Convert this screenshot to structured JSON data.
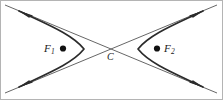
{
  "figure": {
    "kind": "hyperbola-diagram",
    "background_color": "#ffffff",
    "stroke_color": "#3c3c3c",
    "curve_color": "#2b2b2b",
    "border_color": "#b4b4b4",
    "point_color": "#111111"
  },
  "labels": {
    "focus_left": {
      "base": "F",
      "sub": "1"
    },
    "focus_right": {
      "base": "F",
      "sub": "2"
    },
    "center": "C"
  },
  "points": {
    "focus_left": {
      "x": 63,
      "y": 49
    },
    "focus_right": {
      "x": 157,
      "y": 49
    },
    "center": {
      "x": 111,
      "y": 49
    }
  },
  "geometry": {
    "center_x": 111,
    "center_y": 49,
    "vertex_left_x": 85,
    "vertex_right_x": 137,
    "asymptote_slope": 0.72,
    "arrowhead_count": 4,
    "branch_count": 2,
    "asymptote_count": 2
  },
  "elements": [
    {
      "name": "asymptote-up-right",
      "type": "line"
    },
    {
      "name": "asymptote-up-left",
      "type": "line"
    },
    {
      "name": "hyperbola-branch-left",
      "type": "curve"
    },
    {
      "name": "hyperbola-branch-right",
      "type": "curve"
    },
    {
      "name": "arrowhead-top-left",
      "type": "arrow"
    },
    {
      "name": "arrowhead-top-right",
      "type": "arrow"
    },
    {
      "name": "arrowhead-bottom-left",
      "type": "arrow"
    },
    {
      "name": "arrowhead-bottom-right",
      "type": "arrow"
    }
  ]
}
